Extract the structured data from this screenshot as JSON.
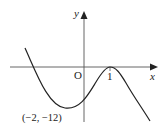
{
  "diagram": {
    "type": "function-graph",
    "axes": {
      "x_label": "x",
      "y_label": "y",
      "origin_label": "O"
    },
    "ticks": {
      "x_tick_label": "1"
    },
    "points": {
      "minimum_label": "(−2, −12)"
    },
    "colors": {
      "curve": "#222222",
      "axes": "#555555",
      "background": "#ffffff"
    }
  }
}
